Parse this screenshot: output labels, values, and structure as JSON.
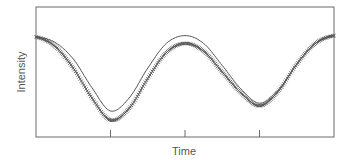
{
  "chart_data": {
    "type": "line",
    "title": "",
    "xlabel": "Time",
    "ylabel": "Intensity",
    "xlim": [
      0,
      4
    ],
    "ylim": [
      0,
      1
    ],
    "x_ticks": [
      1,
      2,
      3
    ],
    "x_tick_labels": [
      "",
      "",
      ""
    ],
    "y_ticks": [],
    "grid": false,
    "legend": null,
    "series": [
      {
        "name": "model",
        "style": "solid-line",
        "color": "#555555",
        "x": [
          0,
          0.25,
          0.5,
          0.75,
          1.0,
          1.25,
          1.5,
          1.75,
          2.0,
          2.25,
          2.5,
          2.75,
          3.0,
          3.25,
          3.5,
          3.75,
          4.0
        ],
        "values": [
          0.77,
          0.73,
          0.6,
          0.38,
          0.2,
          0.3,
          0.53,
          0.72,
          0.78,
          0.72,
          0.55,
          0.37,
          0.26,
          0.36,
          0.56,
          0.72,
          0.78
        ]
      },
      {
        "name": "data",
        "style": "crosses",
        "color": "#555555",
        "x": [
          0,
          0.25,
          0.5,
          0.75,
          1.0,
          1.25,
          1.5,
          1.75,
          2.0,
          2.25,
          2.5,
          2.75,
          3.0,
          3.25,
          3.5,
          3.75,
          4.0
        ],
        "values": [
          0.77,
          0.7,
          0.53,
          0.3,
          0.13,
          0.22,
          0.45,
          0.65,
          0.72,
          0.66,
          0.5,
          0.34,
          0.24,
          0.35,
          0.56,
          0.72,
          0.78
        ]
      }
    ]
  },
  "labels": {
    "xlabel": "Time",
    "ylabel": "Intensity"
  },
  "colors": {
    "axis": "#666666",
    "series": "#555555",
    "background": "#ffffff"
  }
}
